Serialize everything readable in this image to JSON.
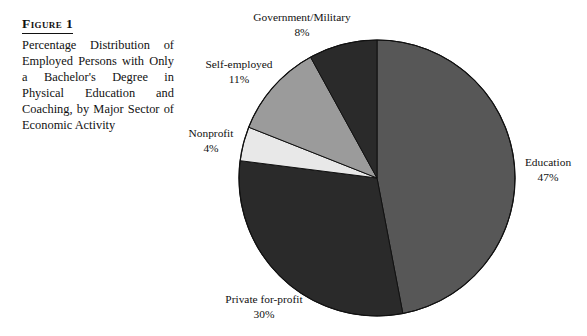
{
  "figure": {
    "label": "Figure 1",
    "caption": "Percentage Distribution of Employed Persons with Only a Bachelor's Degree in Physical Education and Coaching, by Major Sector of Economic Activity"
  },
  "chart_data": {
    "type": "pie",
    "title": "Percentage Distribution of Employed Persons with Only a Bachelor's Degree in Physical Education and Coaching, by Major Sector of Economic Activity",
    "xlabel": "",
    "ylabel": "",
    "units": "percent",
    "start_angle_deg": 0,
    "direction": "clockwise",
    "legend": "none",
    "grid": false,
    "categories": [
      "Education",
      "Private for-profit",
      "Nonprofit",
      "Self-employed",
      "Government/Military"
    ],
    "values": [
      47,
      30,
      4,
      11,
      8
    ],
    "colors": [
      "#575757",
      "#2a2a2a",
      "#e8e8e8",
      "#9b9b9b",
      "#2a2a2a"
    ],
    "slices": [
      {
        "name": "Education",
        "value": 47,
        "value_text": "47%",
        "color": "#575757"
      },
      {
        "name": "Private for-profit",
        "value": 30,
        "value_text": "30%",
        "color": "#2a2a2a"
      },
      {
        "name": "Nonprofit",
        "value": 4,
        "value_text": "4%",
        "color": "#e8e8e8"
      },
      {
        "name": "Self-employed",
        "value": 11,
        "value_text": "11%",
        "color": "#9b9b9b"
      },
      {
        "name": "Government/Military",
        "value": 8,
        "value_text": "8%",
        "color": "#2a2a2a"
      }
    ]
  },
  "colors": {
    "background": "#ffffff",
    "text": "#111111",
    "outline": "#111111"
  }
}
